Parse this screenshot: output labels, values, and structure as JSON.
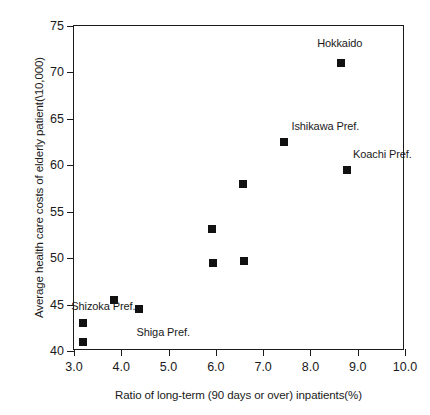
{
  "chart_data": {
    "type": "scatter",
    "title": "",
    "xlabel": "Ratio of long-term (90 days or over) inpatients(%)",
    "ylabel": "Average health care costs of elderly patient(\\10,000)",
    "xlim": [
      3.0,
      10.0
    ],
    "ylim": [
      40,
      75
    ],
    "xticks": [
      "3.0",
      "4.0",
      "5.0",
      "6.0",
      "7.0",
      "8.0",
      "9.0",
      "10.0"
    ],
    "xtick_values": [
      3.0,
      4.0,
      5.0,
      6.0,
      7.0,
      8.0,
      9.0,
      10.0
    ],
    "yticks": [
      "40",
      "45",
      "50",
      "55",
      "60",
      "65",
      "70",
      "75"
    ],
    "ytick_values": [
      40,
      45,
      50,
      55,
      60,
      65,
      70,
      75
    ],
    "grid": false,
    "legend": null,
    "marker_color": "#111111",
    "marker_shape": "square",
    "points": [
      {
        "x": 3.18,
        "y": 41.0,
        "label": "",
        "label_pos": ""
      },
      {
        "x": 3.18,
        "y": 43.0,
        "label": "",
        "label_pos": ""
      },
      {
        "x": 3.85,
        "y": 45.5,
        "label": "",
        "label_pos": ""
      },
      {
        "x": 4.37,
        "y": 44.5,
        "label": "",
        "label_pos": ""
      },
      {
        "x": 5.92,
        "y": 53.1,
        "label": "",
        "label_pos": ""
      },
      {
        "x": 5.95,
        "y": 49.5,
        "label": "",
        "label_pos": ""
      },
      {
        "x": 6.6,
        "y": 49.7,
        "label": "",
        "label_pos": ""
      },
      {
        "x": 6.58,
        "y": 58.0,
        "label": "",
        "label_pos": ""
      },
      {
        "x": 7.45,
        "y": 62.5,
        "label": "Ishikawa Pref.",
        "label_pos": "above-right"
      },
      {
        "x": 8.65,
        "y": 71.0,
        "label": "Hokkaido",
        "label_pos": "above"
      },
      {
        "x": 8.78,
        "y": 59.5,
        "label": "Koachi Pref.",
        "label_pos": "above-right"
      }
    ],
    "annotations": [
      {
        "text": "Shizoka Pref.",
        "x": 4.3,
        "y": 44.9,
        "anchor": "end"
      },
      {
        "text": "Shiga Pref.",
        "x": 5.45,
        "y": 42.0,
        "anchor": "end"
      },
      {
        "text": "Hokkaido",
        "x": 8.62,
        "y": 73.2,
        "anchor": "mid"
      },
      {
        "text": "Ishikawa Pref.",
        "x": 7.6,
        "y": 64.2,
        "anchor": "start"
      },
      {
        "text": "Koachi Pref.",
        "x": 8.9,
        "y": 61.2,
        "anchor": "start"
      }
    ]
  }
}
